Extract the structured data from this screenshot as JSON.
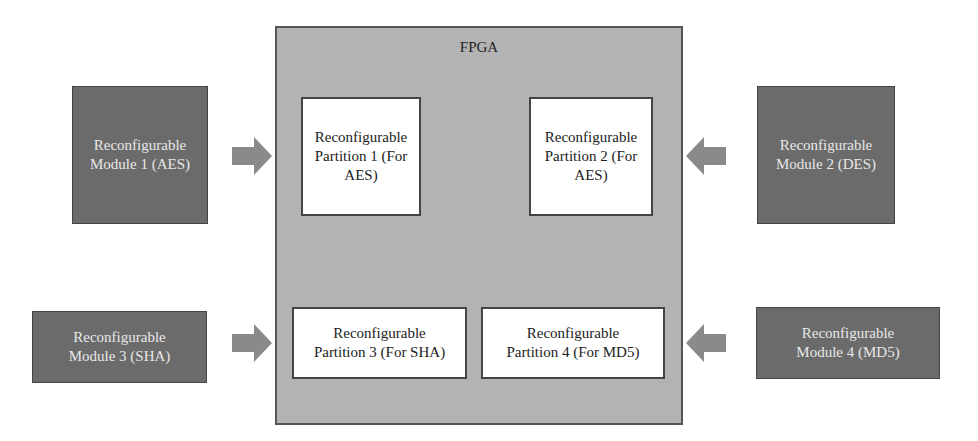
{
  "fpga": {
    "title": "FPGA"
  },
  "partitions": [
    {
      "label": "Reconfigurable\nPartition 1 (For\nAES)"
    },
    {
      "label": "Reconfigurable\nPartition 2 (For\nAES)"
    },
    {
      "label": "Reconfigurable\nPartition 3 (For SHA)"
    },
    {
      "label": "Reconfigurable\nPartition 4 (For MD5)"
    }
  ],
  "modules": [
    {
      "label": "Reconfigurable\nModule 1 (AES)"
    },
    {
      "label": "Reconfigurable\nModule 2 (DES)"
    },
    {
      "label": "Reconfigurable\nModule 3 (SHA)"
    },
    {
      "label": "Reconfigurable\nModule 4 (MD5)"
    }
  ],
  "colors": {
    "fpga_fill": "#b3b3b3",
    "module_fill": "#6b6b6b",
    "arrow_fill": "#8a8a8a",
    "partition_fill": "#ffffff"
  }
}
